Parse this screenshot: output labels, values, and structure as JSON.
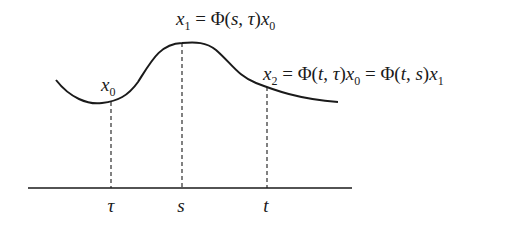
{
  "figure": {
    "type": "state-transition-diagram",
    "axis": {
      "ticks": [
        {
          "symbol": "τ",
          "x": 111
        },
        {
          "symbol": "s",
          "x": 182
        },
        {
          "symbol": "t",
          "x": 267
        }
      ]
    },
    "labels": {
      "x0": {
        "base": "x",
        "sub": "0"
      },
      "x1_equation": {
        "lhs_base": "x",
        "lhs_sub": "1",
        "eq": " = ",
        "phi": "Φ",
        "args_open": "(",
        "arg1": "s",
        "comma": ", ",
        "arg2": "τ",
        "args_close": ")",
        "rhs_base": "x",
        "rhs_sub": "0"
      },
      "x2_equation": {
        "lhs_base": "x",
        "lhs_sub": "2",
        "eq1": " = ",
        "phi1": "Φ",
        "open1": "(",
        "a1": "t",
        "comma1": ", ",
        "a2": "τ",
        "close1": ")",
        "mid_base": "x",
        "mid_sub": "0",
        "eq2": " = ",
        "phi2": "Φ",
        "open2": "(",
        "b1": "t",
        "comma2": ", ",
        "b2": "s",
        "close2": ")",
        "rhs_base": "x",
        "rhs_sub": "1"
      }
    },
    "colors": {
      "stroke": "#1a1a1a",
      "background": "#ffffff"
    }
  }
}
